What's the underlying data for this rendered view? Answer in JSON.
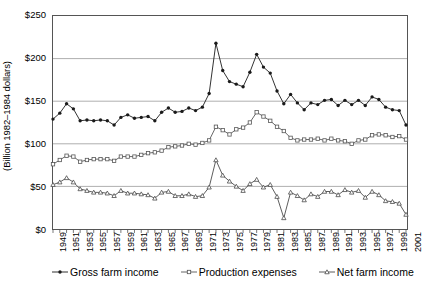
{
  "chart_data": {
    "type": "line",
    "title": "",
    "xlabel": "",
    "ylabel": "(Billion 1982–1984 dollars)",
    "ylim": [
      0,
      250
    ],
    "ytick_labels": [
      "$250",
      "$200",
      "$150",
      "$100",
      "$50",
      "$0"
    ],
    "ytick_values": [
      250,
      200,
      150,
      100,
      50,
      0
    ],
    "grid": true,
    "grid_axis": "y",
    "legend_position": "bottom",
    "x_tick_step": 2,
    "x": [
      1949,
      1950,
      1951,
      1952,
      1953,
      1954,
      1955,
      1956,
      1957,
      1958,
      1959,
      1960,
      1961,
      1962,
      1963,
      1964,
      1965,
      1966,
      1967,
      1968,
      1969,
      1970,
      1971,
      1972,
      1973,
      1974,
      1975,
      1976,
      1977,
      1978,
      1979,
      1980,
      1981,
      1982,
      1983,
      1984,
      1985,
      1986,
      1987,
      1988,
      1989,
      1990,
      1991,
      1992,
      1993,
      1994,
      1995,
      1996,
      1997,
      1998,
      1999,
      2000,
      2001
    ],
    "xtick_labels": [
      "1949",
      "1951",
      "1953",
      "1955",
      "1957",
      "1959",
      "1961",
      "1963",
      "1965",
      "1967",
      "1969",
      "1971",
      "1973",
      "1975",
      "1977",
      "1979",
      "1981",
      "1983",
      "1985",
      "1987",
      "1989",
      "1991",
      "1993",
      "1995",
      "1997",
      "1999",
      "2001"
    ],
    "series": [
      {
        "name": "Gross farm income",
        "marker": "filled-circle",
        "color": "#1a1a1a",
        "values": [
          129,
          136,
          147,
          141,
          127,
          128,
          127,
          128,
          127,
          122,
          131,
          134,
          130,
          131,
          132,
          127,
          137,
          142,
          137,
          138,
          142,
          139,
          143,
          159,
          218,
          186,
          173,
          170,
          167,
          184,
          205,
          190,
          183,
          162,
          147,
          158,
          148,
          140,
          148,
          146,
          151,
          152,
          145,
          151,
          146,
          151,
          145,
          155,
          152,
          143,
          140,
          139,
          122
        ]
      },
      {
        "name": "Production expenses",
        "marker": "open-square",
        "color": "#555555",
        "values": [
          76,
          81,
          86,
          85,
          79,
          81,
          82,
          82,
          82,
          80,
          85,
          85,
          85,
          87,
          89,
          90,
          92,
          96,
          97,
          98,
          100,
          99,
          101,
          104,
          120,
          116,
          111,
          117,
          119,
          125,
          137,
          132,
          127,
          120,
          115,
          107,
          104,
          105,
          105,
          106,
          104,
          106,
          104,
          103,
          100,
          104,
          105,
          110,
          111,
          110,
          108,
          109,
          105
        ]
      },
      {
        "name": "Net farm income",
        "marker": "open-triangle",
        "color": "#4a4a4a",
        "values": [
          52,
          55,
          60,
          55,
          47,
          45,
          43,
          43,
          42,
          39,
          45,
          42,
          42,
          41,
          40,
          36,
          43,
          44,
          39,
          39,
          41,
          38,
          39,
          49,
          81,
          63,
          56,
          50,
          45,
          53,
          58,
          49,
          52,
          38,
          13,
          43,
          39,
          34,
          41,
          38,
          44,
          44,
          40,
          46,
          43,
          45,
          37,
          44,
          40,
          33,
          32,
          30,
          17
        ]
      }
    ]
  },
  "legend": {
    "items": [
      {
        "label": "Gross farm income",
        "marker": "filled-circle"
      },
      {
        "label": "Production expenses",
        "marker": "open-square"
      },
      {
        "label": "Net farm income",
        "marker": "open-triangle"
      }
    ]
  }
}
